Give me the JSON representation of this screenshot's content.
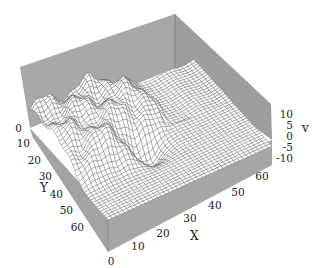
{
  "chart_data": {
    "type": "surface3d",
    "title": "",
    "xlabel": "X",
    "ylabel": "Y",
    "zlabel": "v",
    "x_ticks": [
      "0",
      "10",
      "20",
      "30",
      "40",
      "50",
      "60"
    ],
    "y_ticks": [
      "0",
      "10",
      "20",
      "30",
      "40",
      "50",
      "60"
    ],
    "z_ticks": [
      "10",
      "5",
      "0",
      "-5",
      "-10"
    ],
    "xlim": [
      0,
      64
    ],
    "ylim": [
      0,
      64
    ],
    "zlim": [
      -12,
      12
    ],
    "grid_resolution": 64,
    "style": "wireframe mesh, white faces, dark grid lines, gray box walls"
  },
  "colors": {
    "wall": "#a6a6a6",
    "wall_dark": "#8f8f8f",
    "mesh_face": "#ffffff",
    "mesh_line": "#444444"
  }
}
